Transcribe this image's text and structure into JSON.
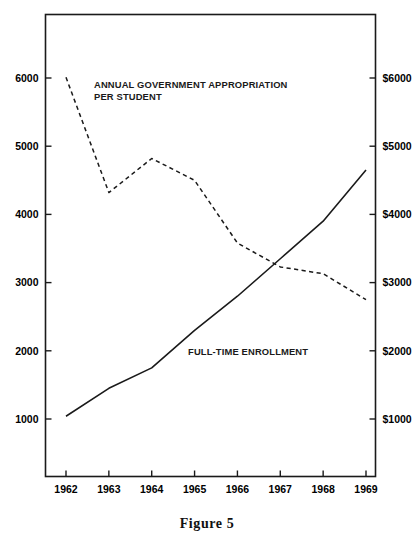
{
  "figure": {
    "caption": "Figure 5"
  },
  "chart_data": {
    "type": "line",
    "title": "",
    "subtitle": "",
    "xlabel": "",
    "ylabel": "",
    "y2label": "",
    "x": [
      1962,
      1963,
      1964,
      1965,
      1966,
      1967,
      1968,
      1969
    ],
    "xtick_labels": [
      "1962",
      "1963",
      "1964",
      "1965",
      "1966",
      "1967",
      "1968",
      "1969"
    ],
    "xlim": [
      1962,
      1969
    ],
    "ylim": [
      0,
      6800
    ],
    "ytick_values": [
      1000,
      2000,
      3000,
      4000,
      5000,
      6000
    ],
    "ytick_labels": [
      "1000",
      "2000",
      "3000",
      "4000",
      "5000",
      "6000"
    ],
    "y2tick_values": [
      1000,
      2000,
      3000,
      4000,
      5000,
      6000
    ],
    "y2tick_labels": [
      "$1000",
      "$2000",
      "$3000",
      "$4000",
      "$5000",
      "$6000"
    ],
    "grid": false,
    "legend_position": "inline-annotations",
    "series": [
      {
        "name": "ANNUAL GOVERNMENT APPROPRIATION PER STUDENT",
        "axis": "right",
        "style": "dashed",
        "color": "#1a1a1a",
        "values": [
          6010,
          4320,
          4820,
          4500,
          3580,
          3230,
          3130,
          2750
        ]
      },
      {
        "name": "FULL-TIME ENROLLMENT",
        "axis": "left",
        "style": "solid",
        "color": "#1a1a1a",
        "values": [
          1040,
          1450,
          1750,
          2300,
          2800,
          3350,
          3900,
          4650
        ]
      }
    ],
    "annotations": [
      {
        "id": "appropriation-label",
        "lines": [
          "ANNUAL GOVERNMENT APPROPRIATION",
          "PER STUDENT"
        ],
        "x_px": 94,
        "y_px": 88
      },
      {
        "id": "enrollment-label",
        "lines": [
          "FULL-TIME ENROLLMENT"
        ],
        "x_px": 188,
        "y_px": 355
      }
    ]
  }
}
